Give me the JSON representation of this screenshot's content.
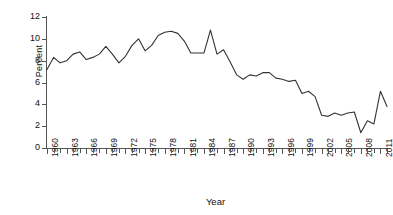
{
  "chart_data": {
    "type": "line",
    "title": "",
    "xlabel": "Year",
    "ylabel": "Percent",
    "ylim": [
      0,
      12
    ],
    "yticks": [
      0,
      2,
      4,
      6,
      8,
      10,
      12
    ],
    "xlim": [
      1960,
      2012
    ],
    "xticks_labeled": [
      1960,
      1963,
      1966,
      1969,
      1972,
      1975,
      1978,
      1981,
      1984,
      1987,
      1990,
      1993,
      1996,
      1999,
      2002,
      2005,
      2008,
      2011
    ],
    "xtick_interval_minor": 1,
    "grid": false,
    "legend": false,
    "line_color": "#333333",
    "x": [
      1960,
      1961,
      1962,
      1963,
      1964,
      1965,
      1966,
      1967,
      1968,
      1969,
      1970,
      1971,
      1972,
      1973,
      1974,
      1975,
      1976,
      1977,
      1978,
      1979,
      1980,
      1981,
      1982,
      1983,
      1984,
      1985,
      1986,
      1987,
      1988,
      1989,
      1990,
      1991,
      1992,
      1993,
      1994,
      1995,
      1996,
      1997,
      1998,
      1999,
      2000,
      2001,
      2002,
      2003,
      2004,
      2005,
      2006,
      2007,
      2008,
      2009,
      2010,
      2011,
      2012
    ],
    "values": [
      7.2,
      8.3,
      7.8,
      8.0,
      8.6,
      8.8,
      8.1,
      8.3,
      8.6,
      9.3,
      8.6,
      7.8,
      8.4,
      9.4,
      10.0,
      8.9,
      9.4,
      10.3,
      10.6,
      10.7,
      10.5,
      9.8,
      8.7,
      8.7,
      8.7,
      10.8,
      8.6,
      9.0,
      7.9,
      6.7,
      6.3,
      6.7,
      6.6,
      6.9,
      6.9,
      6.4,
      6.3,
      6.1,
      6.2,
      5.0,
      5.2,
      4.7,
      3.0,
      2.9,
      3.2,
      3.0,
      3.2,
      3.3,
      1.4,
      2.5,
      2.2,
      5.2,
      3.8
    ]
  },
  "axis": {
    "y_label": "Percent",
    "x_label": "Year",
    "y_tick_labels": [
      "12",
      "10",
      "8",
      "6",
      "4",
      "2",
      "0"
    ],
    "x_tick_labels": [
      "1960",
      "1963",
      "1966",
      "1969",
      "1972",
      "1975",
      "1978",
      "1981",
      "1984",
      "1987",
      "1990",
      "1993",
      "1996",
      "1999",
      "2002",
      "2005",
      "2008",
      "2011"
    ]
  }
}
